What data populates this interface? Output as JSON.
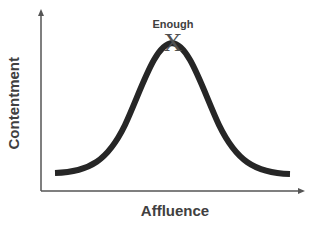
{
  "diagram": {
    "y_axis_label": "Contentment",
    "x_axis_label": "Affluence",
    "peak_label": "Enough",
    "peak_marker": "X",
    "curve_shape": "bell curve",
    "colors": {
      "curve": "#262626",
      "axis": "#555555",
      "text": "#404040"
    }
  }
}
